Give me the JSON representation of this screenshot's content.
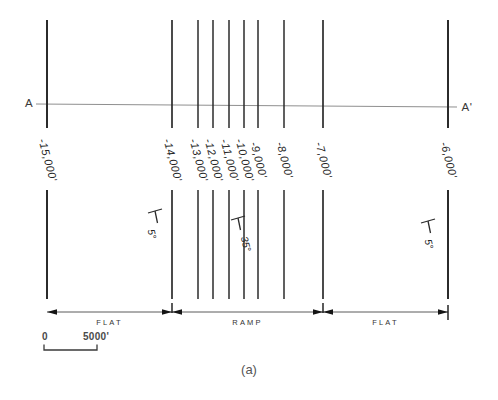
{
  "figure": {
    "caption": "(a)",
    "section_label_left": "A",
    "section_label_right": "A'",
    "contours": [
      {
        "label": "-15,000'",
        "x": 47,
        "w": 2.0
      },
      {
        "label": "-14,000'",
        "x": 172,
        "w": 1.7
      },
      {
        "label": "-13,000'",
        "x": 198,
        "w": 1.5
      },
      {
        "label": "-12,000'",
        "x": 213,
        "w": 1.5
      },
      {
        "label": "-11,000'",
        "x": 229,
        "w": 1.5
      },
      {
        "label": "-10,000'",
        "x": 244,
        "w": 1.5
      },
      {
        "label": "-9,000'",
        "x": 258,
        "w": 1.5
      },
      {
        "label": "-8,000'",
        "x": 284,
        "w": 1.5
      },
      {
        "label": "-7,000'",
        "x": 323,
        "w": 1.7
      },
      {
        "label": "-6,000'",
        "x": 448,
        "w": 2.0
      }
    ],
    "dip_symbols": [
      {
        "angle": "5°",
        "x": 155,
        "y": 211,
        "tx": -3,
        "ty": 23
      },
      {
        "angle": "35°",
        "x": 238,
        "y": 218,
        "tx": 8,
        "ty": 26
      },
      {
        "angle": "5°",
        "x": 428,
        "y": 221,
        "tx": 1,
        "ty": 23
      }
    ],
    "segments": [
      {
        "label": "FLAT",
        "from": 47,
        "to": 172
      },
      {
        "label": "RAMP",
        "from": 172,
        "to": 323
      },
      {
        "label": "FLAT",
        "from": 323,
        "to": 448
      }
    ],
    "scale": {
      "zero": "0",
      "label": "5000'"
    },
    "colors": {
      "contour_line": "#2b2b2b",
      "section_line": "#8f8f8f",
      "dimension_line": "#5a5a5a",
      "arrowhead": "#151515",
      "text": "#2f2f2f"
    }
  }
}
